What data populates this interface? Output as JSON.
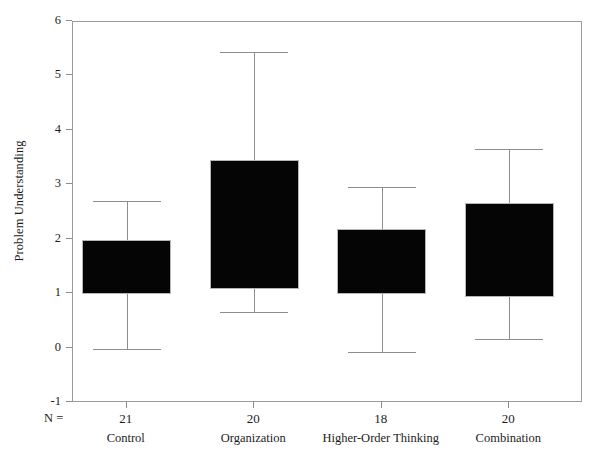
{
  "chart_data": {
    "type": "box",
    "title": "",
    "xlabel": "",
    "ylabel": "Problem Understanding",
    "ylim": [
      -1,
      6
    ],
    "y_ticks": [
      6,
      5,
      4,
      3,
      2,
      1,
      0,
      -1
    ],
    "grid": false,
    "legend": "none",
    "n_prefix": "N =",
    "categories": [
      "Control",
      "Organization",
      "Higher-Order Thinking",
      "Combination"
    ],
    "n_values": [
      21,
      20,
      18,
      20
    ],
    "boxes": [
      {
        "category": "Control",
        "n": 21,
        "whisker_low": 0.0,
        "q1": 1.0,
        "q3": 2.0,
        "whisker_high": 2.72
      },
      {
        "category": "Organization",
        "n": 20,
        "whisker_low": 0.68,
        "q1": 1.09,
        "q3": 3.47,
        "whisker_high": 5.45
      },
      {
        "category": "Higher-Order Thinking",
        "n": 18,
        "whisker_low": -0.07,
        "q1": 1.0,
        "q3": 2.2,
        "whisker_high": 2.97
      },
      {
        "category": "Combination",
        "n": 20,
        "whisker_low": 0.17,
        "q1": 0.95,
        "q3": 2.68,
        "whisker_high": 3.66
      }
    ],
    "colors": {
      "box_fill": "#050505",
      "box_edge": "#b5b5b5",
      "whisker": "#8d8d8d",
      "axis": "#9a9a9a",
      "text": "#1c1c1c",
      "background": "#ffffff"
    }
  }
}
